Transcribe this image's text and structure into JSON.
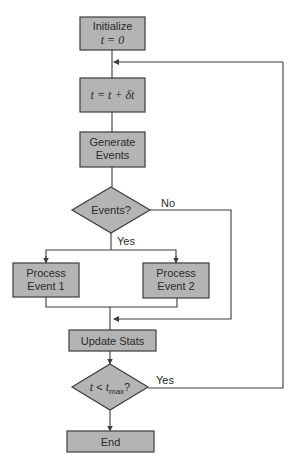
{
  "diagram": {
    "type": "flowchart",
    "colors": {
      "node_fill": "#b4b4b4",
      "stroke": "#3c3c3c",
      "text": "#2a2a2a",
      "background": "#ffffff"
    },
    "nodes": {
      "initialize": {
        "line1": "Initialize",
        "line2": "t = 0"
      },
      "increment": {
        "label": "t = t + δt"
      },
      "generate": {
        "line1": "Generate",
        "line2": "Events"
      },
      "events_decision": {
        "label": "Events?"
      },
      "process1": {
        "line1": "Process",
        "line2": "Event 1"
      },
      "process2": {
        "line1": "Process",
        "line2": "Event 2"
      },
      "update": {
        "label": "Update Stats"
      },
      "time_decision": {
        "t": "t",
        "op": " < ",
        "tmax": "t",
        "sub": "max",
        "q": "?"
      },
      "end": {
        "label": "End"
      }
    },
    "edges": {
      "events_no": "No",
      "events_yes": "Yes",
      "time_yes": "Yes"
    }
  }
}
